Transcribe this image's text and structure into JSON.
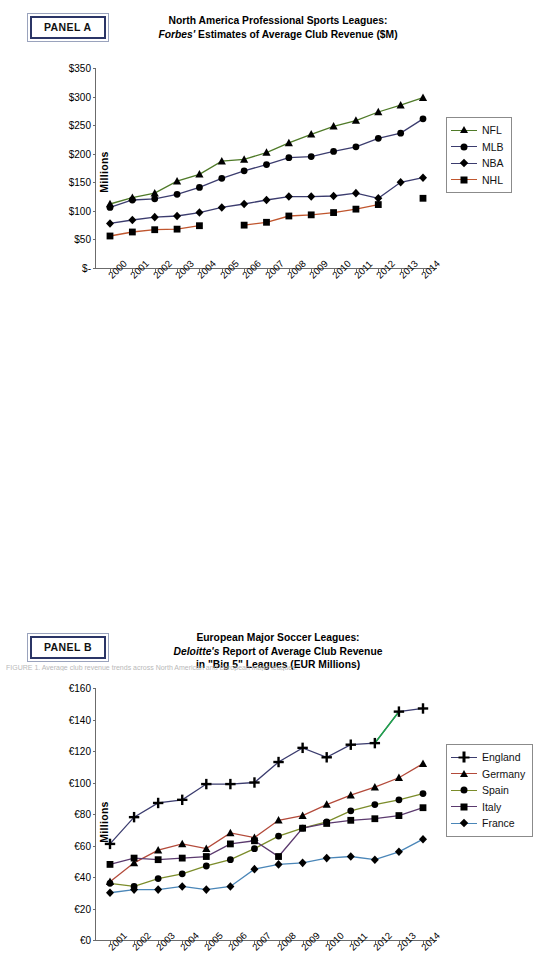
{
  "figure": {
    "footnote": "FIGURE 1. Average club revenue trends across North American and European major leagues."
  },
  "panel_a": {
    "tag": "PANEL A",
    "title_line1": "North America Professional Sports Leagues:",
    "title_line2_italic": "Forbes'",
    "title_line2_rest": " Estimates of Average Club Revenue ($M)",
    "ylabel": "Millions"
  },
  "panel_b": {
    "tag": "PANEL B",
    "title_line1": "European Major Soccer Leagues:",
    "title_line2_italic": "Deloitte's",
    "title_line2_rest": " Report of Average Club Revenue",
    "title_line3": "in \"Big 5\" Leagues (EUR Millions)",
    "ylabel": "Millions"
  },
  "chart_data": [
    {
      "type": "line",
      "panel": "A",
      "title": "North America Professional Sports Leagues: Forbes' Estimates of Average Club Revenue ($M)",
      "xlabel": "",
      "ylabel": "Millions",
      "categories": [
        "2000",
        "2001",
        "2002",
        "2003",
        "2004",
        "2005",
        "2006",
        "2007",
        "2008",
        "2009",
        "2010",
        "2011",
        "2012",
        "2013",
        "2014"
      ],
      "ytick_labels": [
        "$-",
        "$50",
        "$100",
        "$150",
        "$200",
        "$250",
        "$300",
        "$350"
      ],
      "ytick_values": [
        0,
        50,
        100,
        150,
        200,
        250,
        300,
        350
      ],
      "ylim": [
        0,
        350
      ],
      "grid": false,
      "legend_position": "right",
      "series": [
        {
          "name": "NFL",
          "color": "#4f7a28",
          "marker": "triangle",
          "marker_color": "#000000",
          "values": [
            112,
            123,
            131,
            152,
            164,
            187,
            190,
            202,
            219,
            234,
            248,
            258,
            273,
            285,
            298
          ]
        },
        {
          "name": "MLB",
          "color": "#3b3c6e",
          "marker": "circle",
          "marker_color": "#000000",
          "values": [
            106,
            119,
            121,
            129,
            141,
            157,
            170,
            181,
            193,
            195,
            204,
            212,
            227,
            236,
            261
          ]
        },
        {
          "name": "NBA",
          "color": "#3b3c6e",
          "marker": "diamond",
          "marker_color": "#000000",
          "values": [
            78,
            84,
            89,
            91,
            97,
            106,
            112,
            119,
            125,
            125,
            126,
            131,
            122,
            150,
            158
          ]
        },
        {
          "name": "NHL",
          "color": "#c0562e",
          "marker": "square",
          "marker_color": "#000000",
          "values": [
            56,
            63,
            67,
            68,
            74,
            null,
            75,
            80,
            91,
            93,
            97,
            103,
            111,
            null,
            122
          ]
        }
      ],
      "notes": "NHL series has gaps at 2005 (lockout) and 2013; the 2014 NHL point is plotted unconnected."
    },
    {
      "type": "line",
      "panel": "B",
      "title": "European Major Soccer Leagues: Deloitte's Report of Average Club Revenue in \"Big 5\" Leagues (EUR Millions)",
      "xlabel": "",
      "ylabel": "Millions",
      "categories": [
        "2001",
        "2002",
        "2003",
        "2004",
        "2005",
        "2006",
        "2007",
        "2008",
        "2009",
        "2010",
        "2011",
        "2012",
        "2013",
        "2014"
      ],
      "ytick_labels": [
        "€0",
        "€20",
        "€40",
        "€60",
        "€80",
        "€100",
        "€120",
        "€140",
        "€160"
      ],
      "ytick_values": [
        0,
        20,
        40,
        60,
        80,
        100,
        120,
        140,
        160
      ],
      "ylim": [
        0,
        160
      ],
      "grid": false,
      "legend_position": "right",
      "series": [
        {
          "name": "England",
          "color": "#3b3c6e",
          "marker": "plus",
          "marker_color": "#000000",
          "values": [
            61,
            78,
            87,
            89,
            99,
            99,
            100,
            113,
            122,
            116,
            124,
            125,
            145,
            147
          ]
        },
        {
          "name": "Germany",
          "color": "#b34a3a",
          "marker": "triangle",
          "marker_color": "#000000",
          "values": [
            37,
            49,
            57,
            61,
            58,
            68,
            65,
            76,
            79,
            86,
            92,
            97,
            103,
            112
          ]
        },
        {
          "name": "Spain",
          "color": "#7b8c2a",
          "marker": "circle",
          "marker_color": "#000000",
          "values": [
            36,
            34,
            39,
            42,
            47,
            51,
            58,
            66,
            71,
            75,
            82,
            86,
            89,
            93
          ]
        },
        {
          "name": "Italy",
          "color": "#5b3a6e",
          "marker": "square",
          "marker_color": "#000000",
          "values": [
            48,
            52,
            51,
            52,
            53,
            61,
            63,
            53,
            71,
            74,
            76,
            77,
            79,
            84
          ]
        },
        {
          "name": "France",
          "color": "#4a86b8",
          "marker": "diamond",
          "marker_color": "#000000",
          "values": [
            30,
            32,
            32,
            34,
            32,
            34,
            45,
            48,
            49,
            52,
            53,
            51,
            56,
            64
          ]
        }
      ],
      "notes": "England 2013-2014 segment is drawn in green, indicating a highlighted final segment."
    }
  ]
}
